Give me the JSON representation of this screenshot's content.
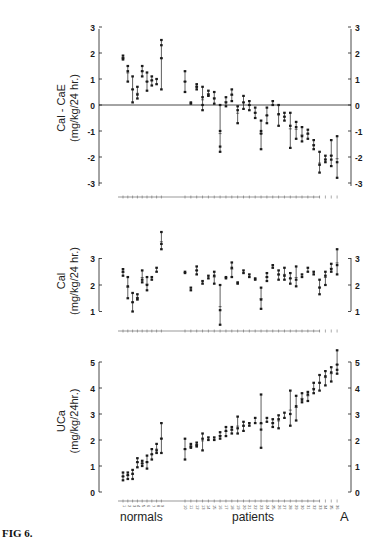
{
  "figure": {
    "caption": "FIG 6.",
    "panel_letter": "A",
    "group_labels": {
      "normals": "normals",
      "patients": "patients"
    }
  },
  "chart_data": [
    {
      "type": "scatter",
      "title": "",
      "ylabel_line1": "Cal - CaE",
      "ylabel_line2": "(mg/kg/24 hr.)",
      "ylim": [
        -3,
        3
      ],
      "yticks": [
        3,
        2,
        1,
        0,
        -1,
        -2,
        -3
      ],
      "ytick_labels": [
        "3",
        "2",
        "1",
        "0",
        "-1",
        "-2",
        "-3"
      ],
      "zero_line": true,
      "grid": false,
      "groups": [
        "normals",
        "patients"
      ],
      "normals": [
        [
          1.9,
          1.8,
          1.75
        ],
        [
          1.5,
          1.3,
          0.9
        ],
        [
          1.1,
          0.6,
          0.1
        ],
        [
          0.7,
          0.4,
          0.25
        ],
        [
          1.5,
          1.3,
          1.1
        ],
        [
          1.25,
          0.9,
          0.55
        ],
        [
          1.1,
          0.95,
          0.75
        ],
        [
          1.0,
          0.8
        ],
        [
          2.5,
          2.3,
          1.8,
          0.6
        ]
      ],
      "patients": [
        [
          1.3,
          0.9,
          0.5
        ],
        [
          0.1,
          0.05
        ],
        [
          0.8,
          0.7,
          0.6
        ],
        [
          0.7,
          0.3,
          0.0,
          -0.2
        ],
        [
          0.55,
          0.4,
          0.35
        ],
        [
          0.5,
          0.25,
          0.05
        ],
        [
          0.0,
          -1.0,
          -1.6,
          -1.8
        ],
        [
          0.3,
          0.1,
          -0.05
        ],
        [
          0.6,
          0.4,
          0.15
        ],
        [
          -0.05,
          -0.2,
          -0.7
        ],
        [
          0.35,
          0.1,
          -0.15
        ],
        [
          0.15,
          0.0,
          -0.2
        ],
        [
          -0.1,
          -0.3,
          -0.5
        ],
        [
          -0.6,
          -1.0,
          -1.1,
          -1.7
        ],
        [
          -0.1,
          -0.4,
          -0.7
        ],
        [
          0.15,
          0.0
        ],
        [
          0.0,
          -0.35,
          -0.8
        ],
        [
          -0.3,
          -0.45,
          -0.6
        ],
        [
          -0.3,
          -0.8,
          -1.65
        ],
        [
          -0.65,
          -0.85,
          -1.3
        ],
        [
          -0.85,
          -1.2,
          -1.4
        ],
        [
          -0.95,
          -1.1,
          -1.3
        ],
        [
          -1.35,
          -1.55,
          -1.7
        ],
        [
          -1.8,
          -2.3,
          -2.6
        ],
        [
          -1.95,
          -2.1,
          -2.2
        ],
        [
          -1.35,
          -1.95,
          -2.1,
          -2.35
        ],
        [
          -1.2,
          -2.2,
          -2.8
        ]
      ]
    },
    {
      "type": "scatter",
      "ylabel_line1": "Cal",
      "ylabel_line2": "(mg/kg/24 hr.)",
      "ylim": [
        0.5,
        4.2
      ],
      "yticks": [
        3,
        2,
        1
      ],
      "ytick_labels": [
        "3",
        "2",
        "1"
      ],
      "grid": false,
      "normals": [
        [
          2.6,
          2.5,
          2.35
        ],
        [
          2.3,
          1.95,
          1.5
        ],
        [
          1.7,
          1.35,
          1.0
        ],
        [
          1.65,
          1.5,
          1.45
        ],
        [
          2.55,
          2.2,
          2.1
        ],
        [
          2.3,
          2.0,
          1.8
        ],
        [
          2.3,
          2.2
        ],
        [
          2.65,
          2.5
        ],
        [
          4.0,
          3.55,
          3.35
        ]
      ],
      "patients": [
        [
          2.5,
          2.45
        ],
        [
          1.9,
          1.8
        ],
        [
          2.7,
          2.55,
          2.4
        ],
        [
          2.15,
          2.05
        ],
        [
          2.35,
          2.25
        ],
        [
          2.5,
          2.35,
          2.05
        ],
        [
          2.0,
          1.05,
          0.5
        ],
        [
          2.3,
          2.25
        ],
        [
          2.85,
          2.65,
          2.3
        ],
        [
          2.1,
          2.05
        ],
        [
          2.55,
          2.45
        ],
        [
          2.4,
          2.3
        ],
        [
          2.25,
          2.2
        ],
        [
          1.9,
          1.45,
          1.1
        ],
        [
          2.45,
          2.3,
          2.15
        ],
        [
          2.75,
          2.65
        ],
        [
          2.55,
          2.4,
          2.2
        ],
        [
          2.65,
          2.35,
          2.2
        ],
        [
          2.45,
          2.25,
          2.05
        ],
        [
          2.7,
          2.2,
          1.95
        ],
        [
          2.4,
          2.3
        ],
        [
          2.65,
          2.5
        ],
        [
          2.5,
          2.4
        ],
        [
          2.2,
          1.9,
          1.65
        ],
        [
          2.5,
          2.35,
          2.0
        ],
        [
          2.8,
          2.6,
          2.5
        ],
        [
          3.35,
          2.75,
          2.4
        ]
      ]
    },
    {
      "type": "scatter",
      "ylabel_line1": "UCa",
      "ylabel_line2": "(mg/kg/24hr.)",
      "ylim": [
        0,
        5.5
      ],
      "yticks": [
        5,
        4,
        3,
        2,
        1,
        0
      ],
      "ytick_labels": [
        "5",
        "4",
        "3",
        "2",
        "1",
        "0"
      ],
      "grid": false,
      "xtick_labels_normals": [
        "1",
        "2",
        "3",
        "4",
        "5",
        "6",
        "7",
        "8",
        "9",
        "10"
      ],
      "xtick_labels_patients": [
        "10",
        "11",
        "12",
        "13",
        "14",
        "15",
        "16",
        "17",
        "18",
        "19",
        "20",
        "21",
        "22",
        "23",
        "24",
        "25",
        "26",
        "27",
        "28",
        "29",
        "30",
        "31",
        "32",
        "33",
        "34",
        "35",
        "36",
        "37",
        "38",
        "39"
      ],
      "normals": [
        [
          0.75,
          0.6,
          0.45
        ],
        [
          0.75,
          0.65,
          0.5
        ],
        [
          0.85,
          0.7,
          0.5
        ],
        [
          1.3,
          1.15,
          0.95
        ],
        [
          1.2,
          1.1,
          1.0
        ],
        [
          1.4,
          1.15,
          0.9
        ],
        [
          1.65,
          1.45,
          1.25
        ],
        [
          1.85,
          1.6,
          1.5
        ],
        [
          2.65,
          2.05,
          1.5
        ]
      ],
      "patients": [
        [
          2.05,
          1.65,
          1.25
        ],
        [
          1.85,
          1.75,
          1.7
        ],
        [
          1.9,
          1.8,
          1.75
        ],
        [
          2.25,
          2.05,
          1.6
        ],
        [
          2.1,
          2.0
        ],
        [
          2.1,
          2.0
        ],
        [
          2.3,
          2.15,
          2.05
        ],
        [
          2.5,
          2.35,
          2.15
        ],
        [
          2.5,
          2.4,
          2.25
        ],
        [
          2.9,
          2.45,
          2.25
        ],
        [
          2.7,
          2.55,
          2.35
        ],
        [
          2.65,
          2.55
        ],
        [
          2.85,
          2.65
        ],
        [
          3.75,
          2.65,
          2.4,
          1.7
        ],
        [
          2.85,
          2.7
        ],
        [
          2.8,
          2.65,
          2.5
        ],
        [
          2.95,
          2.8,
          2.45
        ],
        [
          3.05,
          2.85
        ],
        [
          3.9,
          3.0,
          2.55
        ],
        [
          3.7,
          3.3,
          2.75
        ],
        [
          3.8,
          3.55,
          3.45
        ],
        [
          3.85,
          3.75,
          3.5
        ],
        [
          4.2,
          3.95,
          3.8
        ],
        [
          4.5,
          4.2,
          3.9
        ],
        [
          4.65,
          4.45,
          4.1
        ],
        [
          4.8,
          4.6,
          4.25
        ],
        [
          5.45,
          4.9,
          4.7,
          4.55
        ]
      ]
    }
  ]
}
